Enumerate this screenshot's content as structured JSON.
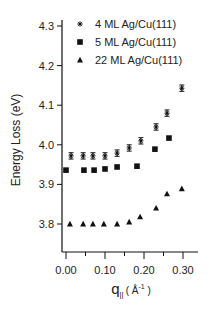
{
  "chart_data": {
    "type": "scatter",
    "title": "",
    "xlabel": "q_|| (Å^-1)",
    "xlabel_main": "q",
    "xlabel_sub": "||",
    "xlabel_unit_open": "( Å",
    "xlabel_unit_sup": "-1",
    "xlabel_unit_close": " )",
    "ylabel": "Energy Loss (eV)",
    "xlim": [
      -0.012,
      0.34
    ],
    "ylim": [
      3.73,
      4.32
    ],
    "x_ticks": [
      0.0,
      0.1,
      0.2,
      0.3
    ],
    "x_tick_labels": [
      "0.00",
      "0.10",
      "0.20",
      "0.30"
    ],
    "x_minor_ticks": [
      0.05,
      0.15,
      0.25
    ],
    "y_ticks": [
      3.8,
      3.9,
      4.0,
      4.1,
      4.2,
      4.3
    ],
    "y_tick_labels": [
      "3.8",
      "3.9",
      "4.0",
      "4.1",
      "4.2",
      "4.3"
    ],
    "grid": false,
    "legend_position": "upper-left",
    "series": [
      {
        "name": "4 ML Ag/Cu(111)",
        "marker": "asterisk",
        "error_bars": true,
        "error": 0.008,
        "x": [
          0.013,
          0.044,
          0.069,
          0.1,
          0.131,
          0.162,
          0.192,
          0.231,
          0.259,
          0.297
        ],
        "y": [
          3.972,
          3.972,
          3.972,
          3.972,
          3.979,
          3.992,
          4.01,
          4.045,
          4.08,
          4.143
        ]
      },
      {
        "name": "5 ML Ag/Cu(111)",
        "marker": "square",
        "error_bars": false,
        "x": [
          0.0,
          0.046,
          0.072,
          0.1,
          0.131,
          0.182,
          0.228,
          0.264
        ],
        "y": [
          3.936,
          3.936,
          3.936,
          3.939,
          3.944,
          3.946,
          3.989,
          4.017
        ]
      },
      {
        "name": "22 ML Ag/Cu(111)",
        "marker": "triangle",
        "error_bars": false,
        "x": [
          0.01,
          0.044,
          0.069,
          0.097,
          0.131,
          0.162,
          0.19,
          0.231,
          0.259,
          0.297
        ],
        "y": [
          3.8,
          3.8,
          3.8,
          3.8,
          3.8,
          3.805,
          3.818,
          3.84,
          3.876,
          3.889
        ]
      }
    ]
  },
  "layout": {
    "plot": {
      "x0": 66,
      "x_per_unit": 390,
      "y0": 224,
      "y_ref": 3.8,
      "y_per_unit": 396,
      "axis_x": 62,
      "axis_y": 252,
      "axis_right": 198,
      "axis_top": 20
    },
    "colors": {
      "ink": "#111111",
      "text": "#222222"
    }
  }
}
